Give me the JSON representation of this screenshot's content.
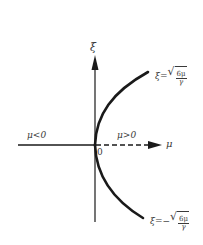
{
  "diagram": {
    "type": "bifurcation-diagram",
    "axes": {
      "vertical": {
        "label": "ξ"
      },
      "horizontal": {
        "label": "μ"
      },
      "origin_label": "0"
    },
    "regions": {
      "left": "μ<0",
      "right": "μ>0"
    },
    "branches": {
      "upper": {
        "lhs": "ξ",
        "eq": "=",
        "sign": "",
        "numerator": "6μ",
        "denominator": "γ"
      },
      "lower": {
        "lhs": "ξ",
        "eq": "=",
        "sign": "−",
        "numerator": "6μ",
        "denominator": "γ"
      }
    },
    "line_styles": {
      "stable_negative_mu": "solid",
      "unstable_positive_mu": "dashed",
      "branches": "solid-thick"
    },
    "colors": {
      "line": "#1a1a1a",
      "text": "#3a3a3a",
      "background": "#ffffff"
    }
  }
}
